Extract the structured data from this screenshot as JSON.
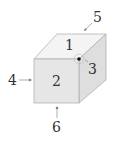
{
  "figure": {
    "faces": {
      "top": "1",
      "front": "2",
      "right": "3"
    },
    "arrows": {
      "left": "4",
      "top_right": "5",
      "bottom": "6"
    },
    "colors": {
      "top_face": "#f4f4f4",
      "front_face": "#e6e6e6",
      "right_face": "#dedede",
      "edge": "#aaaaaa",
      "label": "#333333"
    }
  }
}
